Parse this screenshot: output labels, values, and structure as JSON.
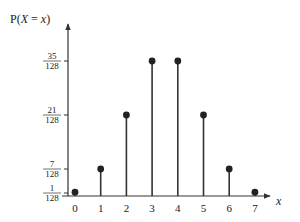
{
  "chart_data": {
    "type": "bar",
    "subtype": "stem",
    "title": "",
    "ylabel": "P(X = x)",
    "xlabel": "x",
    "categories": [
      "0",
      "1",
      "2",
      "3",
      "4",
      "5",
      "6",
      "7"
    ],
    "values": [
      0.0078125,
      0.0546875,
      0.1640625,
      0.2734375,
      0.2734375,
      0.1640625,
      0.0546875,
      0.0078125
    ],
    "values_fraction": [
      "1/128",
      "7/128",
      "21/128",
      "35/128",
      "35/128",
      "21/128",
      "7/128",
      "1/128"
    ],
    "y_ticks": [
      {
        "num": "1",
        "den": "128",
        "value": 0.0078125
      },
      {
        "num": "7",
        "den": "128",
        "value": 0.0546875
      },
      {
        "num": "21",
        "den": "128",
        "value": 0.1640625
      },
      {
        "num": "35",
        "den": "128",
        "value": 0.2734375
      }
    ],
    "ylim": [
      0,
      0.31
    ],
    "grid": false,
    "legend": null
  },
  "colors": {
    "stem": "#333333",
    "axis": "#333333"
  }
}
